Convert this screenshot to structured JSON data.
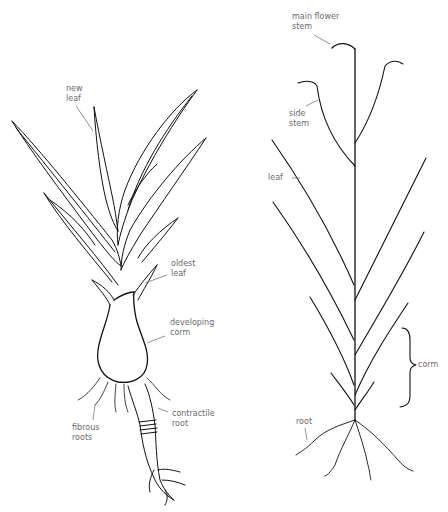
{
  "diagram": {
    "left_plant": {
      "labels": {
        "new_leaf": "new\nleaf",
        "oldest_leaf": "oldest\nleaf",
        "developing_corm": "developing\ncorm",
        "contractile_root": "contractile\nroot",
        "fibrous_roots": "fibrous\nroots"
      }
    },
    "right_plant": {
      "labels": {
        "main_flower_stem": "main flower\nstem",
        "side_stem": "side\nstem",
        "leaf": "leaf",
        "corm": "corm",
        "root": "root"
      }
    },
    "colors": {
      "ink": "#111111",
      "label": "#6a6a6a",
      "leader": "#777777"
    }
  }
}
